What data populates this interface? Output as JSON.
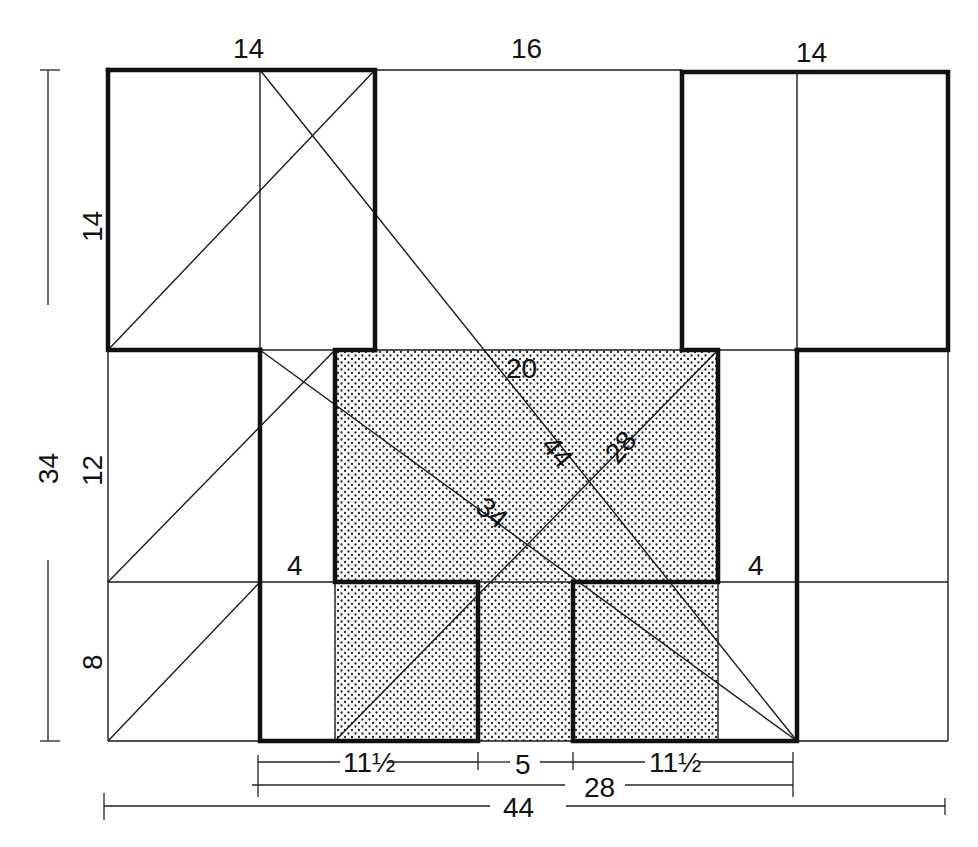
{
  "diagram": {
    "title": "",
    "colors": {
      "ink": "#111111",
      "background": "#ffffff",
      "stipple": "#222222"
    },
    "top_labels": {
      "left_wing": "14",
      "center_gap": "16",
      "right_wing": "14"
    },
    "left_labels": {
      "overall_height": "34",
      "upper": "14",
      "middle": "12",
      "lower": "8"
    },
    "inner_labels": {
      "court_width": "20",
      "diag_44": "44",
      "diag_28": "28",
      "diag_34": "34",
      "left_step": "4",
      "right_step": "4"
    },
    "bottom_labels": {
      "seg_left": "11½",
      "seg_center": "5",
      "seg_right": "11½",
      "inner_total": "28",
      "overall_total": "44"
    }
  }
}
